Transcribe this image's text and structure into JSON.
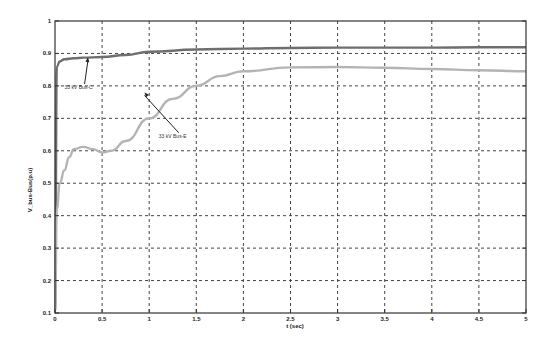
{
  "chart_data": {
    "type": "line",
    "title": "",
    "xlabel": "t (sec)",
    "ylabel": "V_bus-Bus(p.u)",
    "xlim": [
      0,
      5
    ],
    "ylim": [
      0.1,
      1.0
    ],
    "xticks": [
      0,
      0.5,
      1,
      1.5,
      2,
      2.5,
      3,
      3.5,
      4,
      4.5,
      5
    ],
    "xtick_labels": [
      "0",
      "0.5",
      "1",
      "1.5",
      "2",
      "2.5",
      "3",
      "3.5",
      "4",
      "4.5",
      "5"
    ],
    "yticks": [
      0.1,
      0.2,
      0.3,
      0.4,
      0.5,
      0.6,
      0.7,
      0.8,
      0.9,
      1.0
    ],
    "ytick_labels": [
      "0.1",
      "0.2",
      "0.3",
      "0.4",
      "0.5",
      "0.6",
      "0.7",
      "0.8",
      "0.9",
      "1"
    ],
    "grid": true,
    "legend": null,
    "series": [
      {
        "name": "33 kV Bus-C",
        "color": "#6e6e6e",
        "x": [
          0,
          0.02,
          0.05,
          0.1,
          0.2,
          0.3,
          0.5,
          0.75,
          1.0,
          1.5,
          2.0,
          2.5,
          3.0,
          3.5,
          4.0,
          4.5,
          5.0
        ],
        "y": [
          0.1,
          0.86,
          0.875,
          0.882,
          0.885,
          0.887,
          0.889,
          0.895,
          0.905,
          0.912,
          0.915,
          0.917,
          0.918,
          0.918,
          0.918,
          0.919,
          0.919
        ]
      },
      {
        "name": "33 kV Bus-E",
        "color": "#b4b4b4",
        "x": [
          0,
          0.02,
          0.05,
          0.1,
          0.15,
          0.2,
          0.3,
          0.4,
          0.5,
          0.6,
          0.75,
          1.0,
          1.25,
          1.5,
          1.75,
          2.0,
          2.5,
          3.0,
          3.5,
          4.0,
          4.5,
          5.0
        ],
        "y": [
          0.1,
          0.42,
          0.5,
          0.54,
          0.58,
          0.605,
          0.612,
          0.605,
          0.595,
          0.6,
          0.63,
          0.7,
          0.76,
          0.8,
          0.83,
          0.845,
          0.857,
          0.858,
          0.856,
          0.852,
          0.848,
          0.845
        ]
      }
    ],
    "annotations": [
      {
        "text": "33 kV Bus-C",
        "x": 0.25,
        "y": 0.79,
        "arrow_to": [
          0.35,
          0.888
        ]
      },
      {
        "text": "33 kV Bus-E",
        "x": 1.25,
        "y": 0.64,
        "arrow_to": [
          0.95,
          0.78
        ]
      }
    ]
  }
}
